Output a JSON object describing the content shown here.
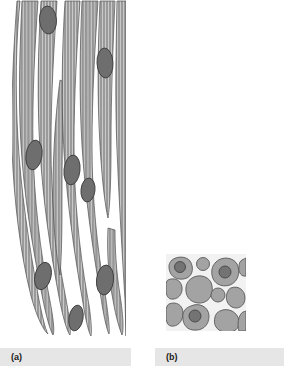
{
  "figure": {
    "background_color": "#ffffff",
    "panels": [
      {
        "id": "a",
        "caption": "(a)",
        "view": "longitudinal-section",
        "subject": "smooth-muscle-fibers",
        "fiber_fill_color": "#9a9a9a",
        "fiber_outline_color": "#4d4d4d",
        "striation_color": "#cfcfcf",
        "nucleus_fill_color": "#6e6e6e",
        "nucleus_outline_color": "#3c3c3c",
        "fiber_count": 9,
        "nucleus_count": 8
      },
      {
        "id": "b",
        "caption": "(b)",
        "view": "cross-section",
        "subject": "smooth-muscle-fibers",
        "cell_fill_color": "#a3a3a3",
        "cell_outline_color": "#5a5a5a",
        "matrix_color": "#f2f2f2",
        "nucleus_fill_color": "#737373",
        "nucleus_outline_color": "#454545",
        "cell_count": 14,
        "nucleus_count": 3
      }
    ],
    "caption_bar": {
      "background_color": "#e6e6e6",
      "text_color": "#1a1a1a"
    }
  }
}
